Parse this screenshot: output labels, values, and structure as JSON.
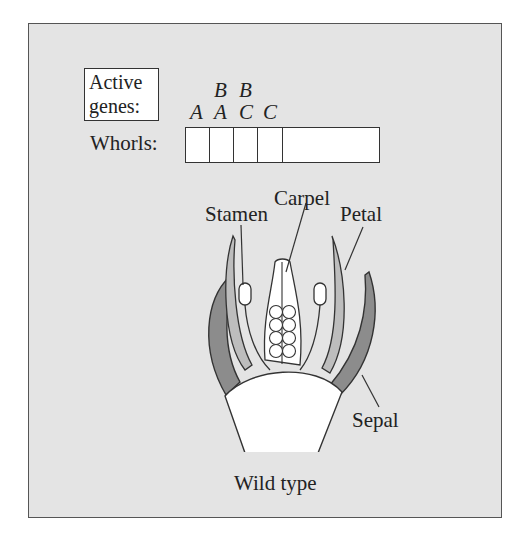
{
  "figure": {
    "legend_label_line1": "Active",
    "legend_label_line2": "genes:",
    "whorls_label": "Whorls:",
    "genes_per_whorl": [
      {
        "whorl": 1,
        "top": "",
        "bottom": "A"
      },
      {
        "whorl": 2,
        "top": "B",
        "bottom": "A"
      },
      {
        "whorl": 3,
        "top": "B",
        "bottom": "C"
      },
      {
        "whorl": 4,
        "top": "",
        "bottom": "C"
      }
    ],
    "organ_labels": {
      "carpel": "Carpel",
      "stamen": "Stamen",
      "petal": "Petal",
      "sepal": "Sepal"
    },
    "caption": "Wild type"
  },
  "colors": {
    "panel_bg": "#e4e4e4",
    "sepal_fill": "#8c8c8c",
    "petal_fill": "#bdbdbd",
    "organ_outline": "#333333",
    "white": "#ffffff"
  }
}
